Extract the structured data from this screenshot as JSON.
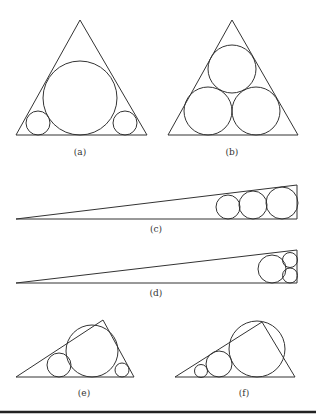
{
  "figure": {
    "panels": [
      {
        "id": "a",
        "label": "(a)",
        "shape": "triangle",
        "triangle": [
          [
            80,
            20
          ],
          [
            16,
            135
          ],
          [
            147,
            135
          ]
        ],
        "circles": [
          {
            "cx": 80,
            "cy": 98,
            "r": 37
          },
          {
            "cx": 38,
            "cy": 123,
            "r": 12
          },
          {
            "cx": 125,
            "cy": 123,
            "r": 12
          }
        ],
        "label_pos": [
          80,
          155
        ]
      },
      {
        "id": "b",
        "label": "(b)",
        "shape": "triangle",
        "triangle": [
          [
            232,
            20
          ],
          [
            168,
            135
          ],
          [
            298,
            135
          ]
        ],
        "circles": [
          {
            "cx": 232,
            "cy": 69,
            "r": 24
          },
          {
            "cx": 208,
            "cy": 111,
            "r": 24
          },
          {
            "cx": 256,
            "cy": 111,
            "r": 24
          }
        ],
        "label_pos": [
          232,
          155
        ]
      },
      {
        "id": "c",
        "label": "(c)",
        "shape": "triangle",
        "triangle": [
          [
            16,
            219
          ],
          [
            297,
            185
          ],
          [
            297,
            219
          ]
        ],
        "circles": [
          {
            "cx": 228,
            "cy": 207,
            "r": 12
          },
          {
            "cx": 253,
            "cy": 205,
            "r": 14
          },
          {
            "cx": 282,
            "cy": 203,
            "r": 16
          }
        ],
        "label_pos": [
          156,
          232
        ]
      },
      {
        "id": "d",
        "label": "(d)",
        "shape": "triangle",
        "triangle": [
          [
            16,
            283
          ],
          [
            297,
            250
          ],
          [
            297,
            283
          ]
        ],
        "circles": [
          {
            "cx": 272,
            "cy": 269,
            "r": 14
          },
          {
            "cx": 290,
            "cy": 260,
            "r": 7.5
          },
          {
            "cx": 290,
            "cy": 275.5,
            "r": 7.5
          }
        ],
        "label_pos": [
          156,
          296
        ]
      },
      {
        "id": "e",
        "label": "(e)",
        "shape": "triangle",
        "triangle": [
          [
            16,
            377
          ],
          [
            103,
            320
          ],
          [
            134,
            377
          ]
        ],
        "circles": [
          {
            "cx": 59,
            "cy": 365,
            "r": 12
          },
          {
            "cx": 92,
            "cy": 351,
            "r": 26
          },
          {
            "cx": 122,
            "cy": 370,
            "r": 7
          }
        ],
        "label_pos": [
          84,
          396
        ]
      },
      {
        "id": "f",
        "label": "(f)",
        "shape": "triangle",
        "triangle": [
          [
            175,
            377
          ],
          [
            262,
            322
          ],
          [
            295,
            377
          ]
        ],
        "circles": [
          {
            "cx": 201,
            "cy": 371,
            "r": 6.5
          },
          {
            "cx": 219,
            "cy": 364,
            "r": 13
          },
          {
            "cx": 257,
            "cy": 349,
            "r": 28
          }
        ],
        "label_pos": [
          244,
          396
        ]
      }
    ],
    "rule": {
      "x1": 0,
      "x2": 316,
      "y": 412
    },
    "stroke_color": "#333333"
  }
}
